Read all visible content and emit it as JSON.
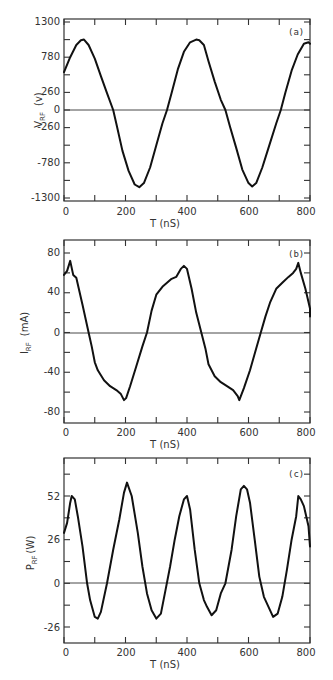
{
  "chart_data": [
    {
      "type": "line",
      "panel": "(a)",
      "title": "",
      "xlabel": "T (nS)",
      "ylabel": "V_RF (v)",
      "xlim": [
        0,
        800
      ],
      "ylim": [
        -1300,
        1300
      ],
      "xticks": [
        0,
        200,
        400,
        600,
        800
      ],
      "yticks": [
        1300,
        780,
        260,
        0,
        -260,
        -780,
        -1300
      ],
      "grid": false,
      "legend": null,
      "series": [
        {
          "name": "V_RF",
          "x": [
            0,
            20,
            40,
            55,
            65,
            80,
            100,
            120,
            140,
            160,
            170,
            190,
            210,
            230,
            245,
            260,
            280,
            300,
            320,
            335,
            350,
            370,
            390,
            410,
            430,
            440,
            455,
            470,
            490,
            510,
            525,
            540,
            560,
            580,
            600,
            612,
            625,
            645,
            665,
            690,
            705,
            720,
            740,
            760,
            780,
            795,
            805
          ],
          "y": [
            560,
            780,
            960,
            1030,
            1040,
            960,
            760,
            500,
            250,
            0,
            -200,
            -600,
            -900,
            -1100,
            -1140,
            -1080,
            -850,
            -520,
            -200,
            0,
            250,
            600,
            860,
            1000,
            1040,
            1030,
            960,
            720,
            420,
            150,
            0,
            -250,
            -560,
            -880,
            -1080,
            -1130,
            -1080,
            -850,
            -560,
            -200,
            0,
            260,
            580,
            820,
            980,
            1000,
            980
          ]
        }
      ]
    },
    {
      "type": "line",
      "panel": "(b)",
      "title": "",
      "xlabel": "T (nS)",
      "ylabel": "I_RF (mA)",
      "xlim": [
        0,
        800
      ],
      "ylim": [
        -80,
        80
      ],
      "xticks": [
        0,
        200,
        400,
        600,
        800
      ],
      "yticks": [
        80,
        40,
        0,
        -40,
        -80
      ],
      "grid": false,
      "legend": null,
      "series": [
        {
          "name": "I_RF",
          "x": [
            0,
            10,
            20,
            30,
            40,
            60,
            80,
            90,
            100,
            110,
            130,
            150,
            170,
            185,
            195,
            202,
            215,
            235,
            255,
            270,
            285,
            300,
            320,
            335,
            350,
            365,
            380,
            390,
            400,
            415,
            430,
            445,
            460,
            470,
            490,
            510,
            530,
            550,
            565,
            570,
            585,
            605,
            625,
            640,
            655,
            670,
            690,
            710,
            730,
            745,
            755,
            762,
            770,
            785,
            800,
            805
          ],
          "y": [
            58,
            62,
            72,
            58,
            55,
            28,
            0,
            -14,
            -30,
            -38,
            -48,
            -54,
            -58,
            -62,
            -68,
            -66,
            -54,
            -34,
            -14,
            0,
            22,
            38,
            46,
            50,
            54,
            56,
            64,
            67,
            64,
            44,
            20,
            2,
            -16,
            -32,
            -44,
            -50,
            -54,
            -58,
            -64,
            -68,
            -56,
            -38,
            -16,
            0,
            16,
            30,
            44,
            50,
            56,
            60,
            64,
            70,
            60,
            44,
            24,
            16
          ]
        }
      ]
    },
    {
      "type": "line",
      "panel": "(c)",
      "title": "",
      "xlabel": "T (nS)",
      "ylabel": "P_RF (W)",
      "xlim": [
        0,
        800
      ],
      "ylim": [
        -26,
        52
      ],
      "xticks": [
        0,
        200,
        400,
        600,
        800
      ],
      "yticks": [
        52,
        26,
        0,
        -26
      ],
      "grid": false,
      "legend": null,
      "series": [
        {
          "name": "P_RF",
          "x": [
            0,
            10,
            20,
            25,
            35,
            45,
            60,
            75,
            85,
            100,
            110,
            120,
            140,
            160,
            180,
            195,
            205,
            220,
            240,
            255,
            270,
            285,
            300,
            315,
            330,
            345,
            360,
            375,
            390,
            400,
            410,
            425,
            440,
            455,
            465,
            480,
            495,
            510,
            525,
            545,
            560,
            575,
            585,
            595,
            605,
            620,
            635,
            650,
            665,
            680,
            695,
            710,
            725,
            740,
            755,
            762,
            770,
            780,
            795,
            805
          ],
          "y": [
            30,
            36,
            48,
            52,
            50,
            40,
            22,
            0,
            -10,
            -20,
            -21,
            -17,
            0,
            20,
            38,
            54,
            60,
            52,
            30,
            10,
            -6,
            -16,
            -21,
            -18,
            -4,
            10,
            26,
            40,
            50,
            52,
            44,
            20,
            0,
            -10,
            -14,
            -19,
            -16,
            -6,
            0,
            20,
            40,
            56,
            58,
            56,
            48,
            26,
            4,
            -8,
            -14,
            -20,
            -18,
            -8,
            8,
            26,
            40,
            52,
            50,
            46,
            34,
            22
          ]
        }
      ]
    }
  ],
  "panels": [
    {
      "tag": "(a)",
      "ylabel_main": "V",
      "ylabel_sub": "RF",
      "ylabel_unit": "(v)",
      "xlabel": "T (nS)",
      "ytick_labels": [
        "1300",
        "780",
        "260",
        "0",
        "-260",
        "-780",
        "-1300"
      ],
      "xtick_labels": [
        "0",
        "200",
        "400",
        "600",
        "800"
      ]
    },
    {
      "tag": "(b)",
      "ylabel_main": "I",
      "ylabel_sub": "RF",
      "ylabel_unit": "(mA)",
      "xlabel": "T (nS)",
      "ytick_labels": [
        "80",
        "40",
        "0",
        "-40",
        "-80"
      ],
      "xtick_labels": [
        "0",
        "200",
        "400",
        "600",
        "800"
      ]
    },
    {
      "tag": "(c)",
      "ylabel_main": "P",
      "ylabel_sub": "RF",
      "ylabel_unit": "(W)",
      "xlabel": "T (nS)",
      "ytick_labels": [
        "52",
        "26",
        "0",
        "-26"
      ],
      "xtick_labels": [
        "0",
        "200",
        "400",
        "600",
        "800"
      ]
    }
  ]
}
